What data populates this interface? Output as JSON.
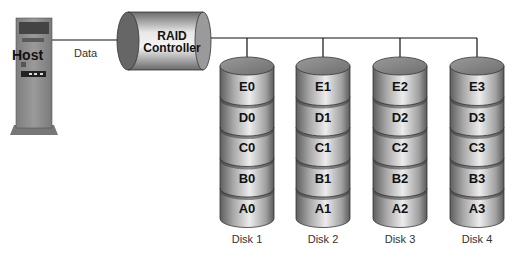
{
  "host": {
    "label": "Host",
    "link_label": "Data"
  },
  "controller": {
    "line1": "RAID",
    "line2": "Controller"
  },
  "disks": [
    {
      "name": "Disk 1",
      "blocks": [
        "E0",
        "D0",
        "C0",
        "B0",
        "A0"
      ]
    },
    {
      "name": "Disk 2",
      "blocks": [
        "E1",
        "D1",
        "C1",
        "B1",
        "A1"
      ]
    },
    {
      "name": "Disk 3",
      "blocks": [
        "E2",
        "D2",
        "C2",
        "B2",
        "A2"
      ]
    },
    {
      "name": "Disk 4",
      "blocks": [
        "E3",
        "D3",
        "C3",
        "B3",
        "A3"
      ]
    }
  ],
  "colors": {
    "host_body": "#8a8a8a",
    "disk_light": "#e6e6e6",
    "disk_dark": "#6a6a6a",
    "line": "#111111"
  }
}
